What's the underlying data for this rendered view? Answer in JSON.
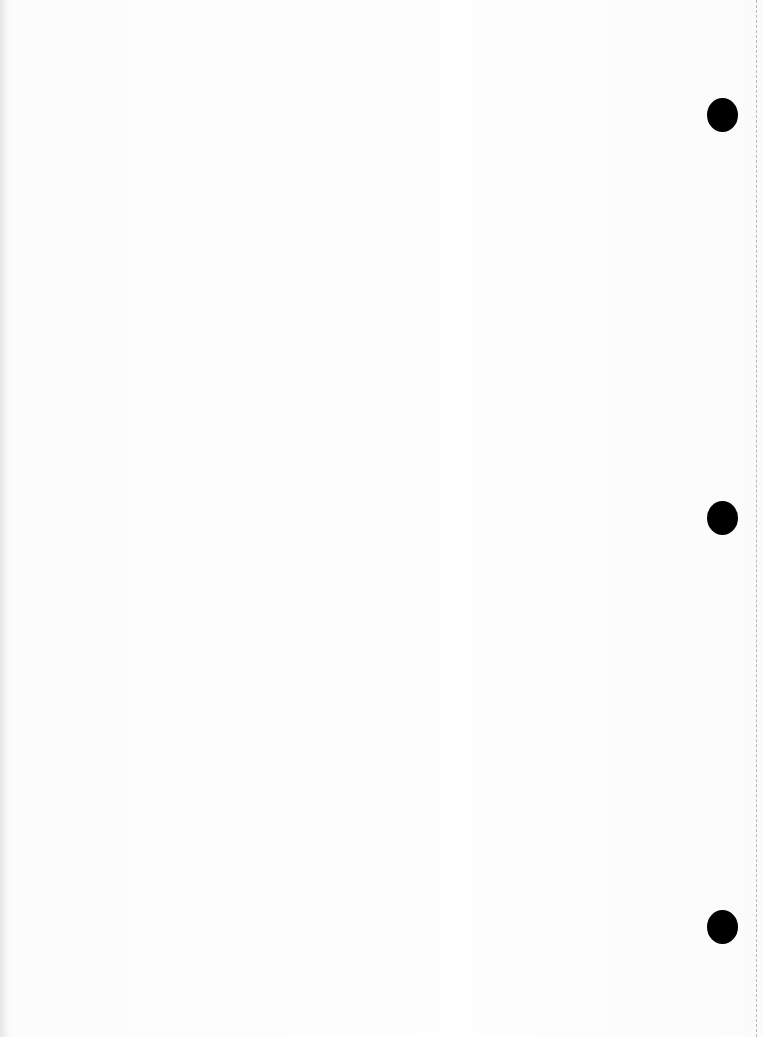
{
  "page": {
    "type": "blank scanned loose-leaf page",
    "background_color": "#fdfdfd",
    "visible_text": []
  },
  "punch_holes": [
    {
      "cx": 722,
      "cy": 115,
      "color": "#000000"
    },
    {
      "cx": 722,
      "cy": 518,
      "color": "#000000"
    },
    {
      "cx": 722,
      "cy": 927,
      "color": "#000000"
    }
  ],
  "perforation": {
    "x": 756,
    "style": "dashed",
    "color": "#b9b9b9"
  }
}
